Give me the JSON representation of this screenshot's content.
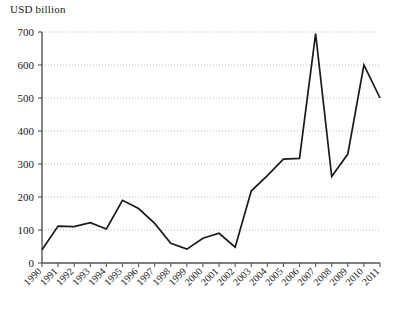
{
  "axis_title": "USD billion",
  "colors": {
    "line": "#1a1a1a",
    "axis": "#555555",
    "grid": "#b9b9b9",
    "background": "#ffffff"
  },
  "chart_data": {
    "type": "line",
    "title": "",
    "subtitle": "",
    "xlabel": "",
    "ylabel": "USD billion",
    "ylim": [
      0,
      700
    ],
    "ytick_values": [
      0,
      100,
      200,
      300,
      400,
      500,
      600,
      700
    ],
    "ytick_labels": [
      "0",
      "100",
      "200",
      "300",
      "400",
      "500",
      "600",
      "700"
    ],
    "grid": true,
    "grid_axis": "y",
    "grid_style": "dotted",
    "legend": false,
    "legend_position": "none",
    "xtick_rotation": 45,
    "categories": [
      "1990",
      "1991",
      "1992",
      "1993",
      "1994",
      "1995",
      "1996",
      "1997",
      "1998",
      "1999",
      "2000",
      "2001",
      "2002",
      "2003",
      "2004",
      "2005",
      "2006",
      "2007",
      "2008",
      "2009",
      "2010",
      "2011"
    ],
    "values": [
      40,
      112,
      110,
      122,
      103,
      190,
      165,
      120,
      60,
      42,
      75,
      90,
      48,
      218,
      265,
      315,
      317,
      695,
      262,
      330,
      600,
      500
    ],
    "series": [
      {
        "name": "USD billion",
        "values": [
          40,
          112,
          110,
          122,
          103,
          190,
          165,
          120,
          60,
          42,
          75,
          90,
          48,
          218,
          265,
          315,
          317,
          695,
          262,
          330,
          600,
          500
        ]
      }
    ]
  },
  "layout": {
    "plot_left": 42,
    "plot_right": 380,
    "plot_top": 32,
    "plot_bottom": 263
  }
}
